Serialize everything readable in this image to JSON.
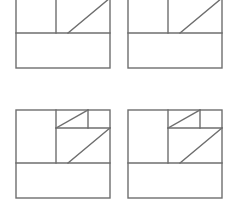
{
  "canvas": {
    "width": 235,
    "height": 200,
    "background": "#ffffff",
    "title": "Geometric Figure Grid"
  },
  "style": {
    "stroke_color": "#6e6e6e",
    "stroke_color_dark": "#555555",
    "fill_color": "#ffffff",
    "stroke_width": 1.4,
    "diagonal_stroke_width": 1.4
  },
  "grid": {
    "rows": 2,
    "columns": 4,
    "cell_count": 4,
    "column_origins_x": [
      16,
      128
    ],
    "row_origins_y": [
      -20,
      110
    ],
    "figure_width": 94,
    "figure_height": 88,
    "note": "top row is cropped by the upper image boundary"
  },
  "figure_geometry": {
    "outer_rect": {
      "x": 0,
      "y": 0,
      "w": 94,
      "h": 88
    },
    "horizontal_divider_y": 53,
    "vertical_divider_x": 40,
    "mid_horizontal_y": 18,
    "mid_horizontal_x_start": 40,
    "mid_horizontal_x_end": 94,
    "small_square": {
      "x": 72,
      "y": 0,
      "w": 22,
      "h": 18
    },
    "diagonal_upper": {
      "x1": 40,
      "y1": 18,
      "x2": 72,
      "y2": 0
    },
    "diagonal_lower": {
      "x1": 52,
      "y1": 53,
      "x2": 94,
      "y2": 18
    }
  },
  "figures": [
    {
      "id": "figure-top-left",
      "label": "Figure 1",
      "row": 0,
      "column": 0,
      "origin_x": 16,
      "origin_y": -20
    },
    {
      "id": "figure-top-right",
      "label": "Figure 2",
      "row": 0,
      "column": 1,
      "origin_x": 128,
      "origin_y": -20
    },
    {
      "id": "figure-bottom-left",
      "label": "Figure 3",
      "row": 1,
      "column": 0,
      "origin_x": 16,
      "origin_y": 110
    },
    {
      "id": "figure-bottom-right",
      "label": "Figure 4",
      "row": 1,
      "column": 1,
      "origin_x": 128,
      "origin_y": 110
    }
  ]
}
